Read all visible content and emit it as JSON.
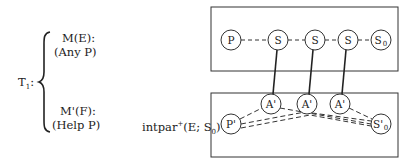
{
  "left_panel": {
    "theory_label": "T",
    "theory_subscript": "1",
    "theory_colon": ":",
    "branch_top": {
      "line1": "M(E):",
      "line2": "(Any P)"
    },
    "branch_bottom": {
      "line1": "M'(F):",
      "line2": "(Help P)"
    },
    "relation_label": "intpar",
    "relation_sup": "+",
    "relation_args_pre": "(E; S",
    "relation_args_sub": "0",
    "relation_args_post": ")"
  },
  "top_box": {
    "nodes": [
      {
        "id": "P",
        "label": "P",
        "sub": ""
      },
      {
        "id": "S1",
        "label": "S",
        "sub": ""
      },
      {
        "id": "S2",
        "label": "S",
        "sub": ""
      },
      {
        "id": "S3",
        "label": "S",
        "sub": ""
      },
      {
        "id": "S0",
        "label": "S",
        "sub": "0"
      }
    ],
    "edges": "dashed chain P - S - S - S - S0"
  },
  "bottom_box": {
    "nodes": [
      {
        "id": "Pp",
        "label": "P'",
        "sub": ""
      },
      {
        "id": "A1",
        "label": "A'",
        "sub": ""
      },
      {
        "id": "A2",
        "label": "A'",
        "sub": ""
      },
      {
        "id": "A3",
        "label": "A'",
        "sub": ""
      },
      {
        "id": "S0p",
        "label": "S'",
        "sub": "0"
      }
    ],
    "edges": "dashed lines from P' and A' nodes converging to S'0"
  },
  "mappings": [
    {
      "from": "S1",
      "to": "A1",
      "style": "solid"
    },
    {
      "from": "S2",
      "to": "A2",
      "style": "solid"
    },
    {
      "from": "S3",
      "to": "A3",
      "style": "solid"
    }
  ]
}
